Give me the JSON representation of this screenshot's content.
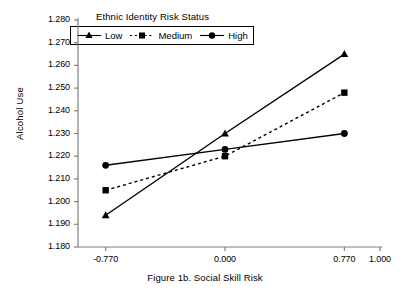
{
  "chart_data": {
    "type": "line",
    "title": "",
    "caption": "Figure 1b. Social Skill Risk",
    "xlabel": "Figure 1b. Social Skill Risk",
    "ylabel": "Alcohol Use",
    "legend_title": "Ethnic Identity Risk Status",
    "legend_position": "top-left-inside",
    "grid": false,
    "x": [
      -0.77,
      0.0,
      0.77
    ],
    "xlim": [
      -1.0,
      1.0
    ],
    "ylim": [
      1.18,
      1.28
    ],
    "xticks": [
      -0.77,
      0.0,
      0.77,
      1.0
    ],
    "xtick_labels": [
      "-0.770",
      "0.000",
      "0.770",
      "1.000"
    ],
    "yticks": [
      1.18,
      1.19,
      1.2,
      1.21,
      1.22,
      1.23,
      1.24,
      1.25,
      1.26,
      1.27,
      1.28
    ],
    "ytick_labels": [
      "1.180",
      "1.190",
      "1.200",
      "1.210",
      "1.220",
      "1.230",
      "1.240",
      "1.250",
      "1.260",
      "1.270",
      "1.280"
    ],
    "series": [
      {
        "name": "Low",
        "marker": "triangle",
        "linestyle": "solid",
        "color": "#000000",
        "values": [
          1.194,
          1.23,
          1.265
        ]
      },
      {
        "name": "Medium",
        "marker": "square",
        "linestyle": "dotted",
        "color": "#000000",
        "values": [
          1.205,
          1.22,
          1.248
        ]
      },
      {
        "name": "High",
        "marker": "circle",
        "linestyle": "solid",
        "color": "#000000",
        "values": [
          1.216,
          1.223,
          1.23
        ]
      }
    ]
  },
  "axes": {
    "axis_color": "#808080",
    "tick_color": "#808080"
  }
}
